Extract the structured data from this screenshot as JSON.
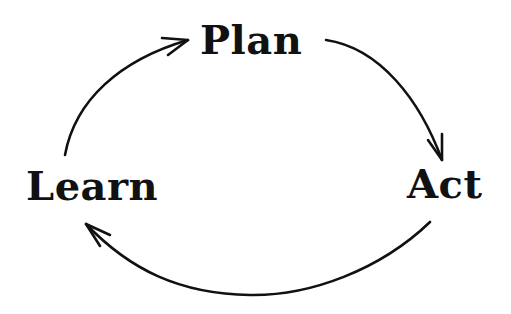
{
  "diagram": {
    "type": "cycle",
    "colors": {
      "ink": "#111111",
      "background": "#ffffff"
    },
    "nodes": [
      {
        "id": "plan",
        "label": "Plan"
      },
      {
        "id": "act",
        "label": "Act"
      },
      {
        "id": "learn",
        "label": "Learn"
      }
    ],
    "edges": [
      {
        "from": "learn",
        "to": "plan"
      },
      {
        "from": "plan",
        "to": "act"
      },
      {
        "from": "act",
        "to": "learn"
      }
    ]
  }
}
